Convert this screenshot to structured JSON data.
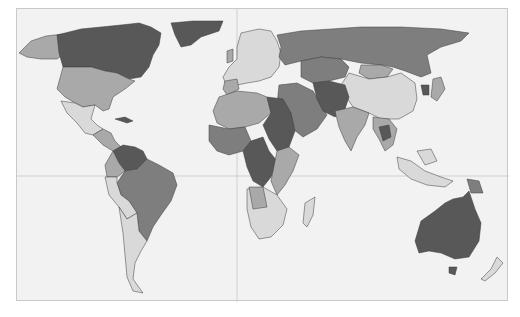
{
  "map": {
    "type": "choropleth",
    "projection": "Mercator-like world",
    "colors": {
      "ocean": "#f2f2f2",
      "class1": "#d9d9d9",
      "class2": "#a9a9a9",
      "class3": "#7e7e7e",
      "class4": "#585858",
      "border": "#3a3a3a",
      "frame": "#c9c9c9",
      "gridlines": "#c8c8c8"
    },
    "gridlines": {
      "equator_y": 175,
      "prime_meridian_x": 236
    },
    "regions": [
      {
        "name": "Canada",
        "class": 4
      },
      {
        "name": "Greenland",
        "class": 4
      },
      {
        "name": "Alaska",
        "class": 2
      },
      {
        "name": "United States",
        "class": 2
      },
      {
        "name": "Mexico",
        "class": 1
      },
      {
        "name": "Central America",
        "class": 2
      },
      {
        "name": "Venezuela/Colombia",
        "class": 4
      },
      {
        "name": "Brazil",
        "class": 3
      },
      {
        "name": "Peru/Bolivia",
        "class": 1
      },
      {
        "name": "Argentina/Chile",
        "class": 1
      },
      {
        "name": "Europe",
        "class": 1
      },
      {
        "name": "Russia",
        "class": 3
      },
      {
        "name": "Kazakhstan",
        "class": 3
      },
      {
        "name": "Mongolia",
        "class": 2
      },
      {
        "name": "China",
        "class": 1
      },
      {
        "name": "India",
        "class": 2
      },
      {
        "name": "Middle East",
        "class": 3
      },
      {
        "name": "Afghanistan/Pakistan",
        "class": 4
      },
      {
        "name": "Southeast Asia",
        "class": 2
      },
      {
        "name": "Indonesia",
        "class": 1
      },
      {
        "name": "Papua New Guinea",
        "class": 3
      },
      {
        "name": "Japan",
        "class": 1
      },
      {
        "name": "North Africa",
        "class": 2
      },
      {
        "name": "Egypt/Sudan",
        "class": 4
      },
      {
        "name": "West Africa",
        "class": 3
      },
      {
        "name": "Central Africa",
        "class": 4
      },
      {
        "name": "East Africa",
        "class": 2
      },
      {
        "name": "Southern Africa",
        "class": 1
      },
      {
        "name": "Madagascar",
        "class": 1
      },
      {
        "name": "Australia",
        "class": 4
      },
      {
        "name": "New Zealand",
        "class": 1
      }
    ]
  }
}
